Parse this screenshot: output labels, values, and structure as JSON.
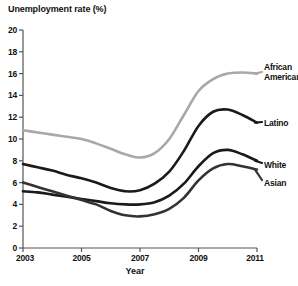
{
  "chart_data": {
    "type": "line",
    "title": "Unemployment rate (%)",
    "xlabel": "Year",
    "ylabel": "Unemployment rate (%)",
    "xlim": [
      2003,
      2011
    ],
    "ylim": [
      0,
      20
    ],
    "grid": false,
    "legend_position": "right-inline",
    "xticks": [
      "2003",
      "2005",
      "2007",
      "2009",
      "2011"
    ],
    "xtick_values": [
      2003,
      2005,
      2007,
      2009,
      2011
    ],
    "yticks": [
      "0",
      "2",
      "4",
      "6",
      "8",
      "10",
      "12",
      "14",
      "16",
      "18",
      "20"
    ],
    "ytick_values": [
      0,
      2,
      4,
      6,
      8,
      10,
      12,
      14,
      16,
      18,
      20
    ],
    "x": [
      2003,
      2003.5,
      2004,
      2004.5,
      2005,
      2005.5,
      2006,
      2006.5,
      2007,
      2007.5,
      2008,
      2008.5,
      2009,
      2009.5,
      2010,
      2010.5,
      2011
    ],
    "series": [
      {
        "name": "African American",
        "label": "African\nAmerican",
        "color": "#a8a8a8",
        "values": [
          10.8,
          10.6,
          10.4,
          10.2,
          10.0,
          9.6,
          9.1,
          8.6,
          8.3,
          8.7,
          10.0,
          12.2,
          14.4,
          15.5,
          16.0,
          16.1,
          16.0
        ]
      },
      {
        "name": "Latino",
        "label": "Latino",
        "color": "#1a1a1a",
        "values": [
          7.7,
          7.4,
          7.1,
          6.7,
          6.4,
          6.0,
          5.5,
          5.2,
          5.3,
          5.9,
          7.0,
          8.9,
          11.2,
          12.5,
          12.7,
          12.2,
          11.5
        ]
      },
      {
        "name": "White",
        "label": "White",
        "color": "#1a1a1a",
        "values": [
          5.2,
          5.1,
          4.9,
          4.7,
          4.5,
          4.3,
          4.1,
          4.0,
          4.0,
          4.2,
          4.8,
          5.9,
          7.5,
          8.7,
          9.0,
          8.6,
          8.0
        ]
      },
      {
        "name": "Asian",
        "label": "Asian",
        "color": "#333333",
        "values": [
          6.0,
          5.6,
          5.2,
          4.8,
          4.4,
          4.0,
          3.4,
          3.0,
          2.9,
          3.1,
          3.6,
          4.6,
          6.2,
          7.3,
          7.7,
          7.5,
          7.2
        ]
      }
    ]
  }
}
